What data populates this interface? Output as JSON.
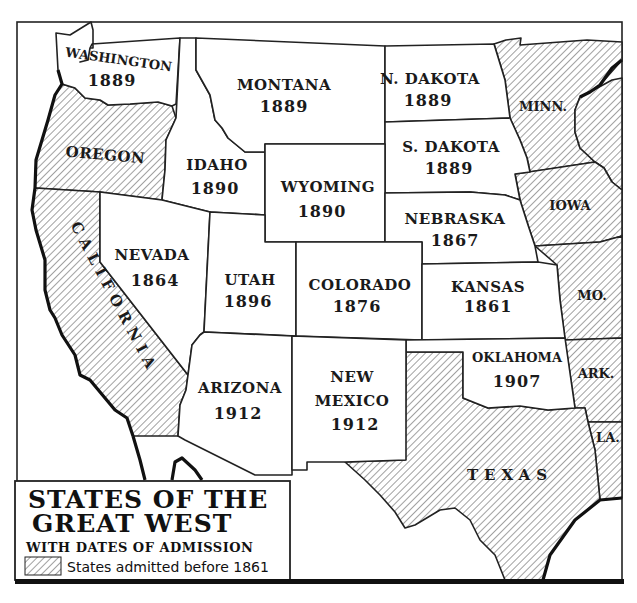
{
  "legend": {
    "title_line1": "STATES OF THE",
    "title_line2": "GREAT WEST",
    "subtitle": "WITH DATES OF ADMISSION",
    "key_label": "States admitted before 1861"
  },
  "states": {
    "washington": {
      "name": "WASHINGTON",
      "year": "1889"
    },
    "montana": {
      "name": "MONTANA",
      "year": "1889"
    },
    "north_dakota": {
      "name": "N. DAKOTA",
      "year": "1889"
    },
    "minnesota": {
      "name": "MINN."
    },
    "oregon": {
      "name": "OREGON"
    },
    "idaho": {
      "name": "IDAHO",
      "year": "1890"
    },
    "wyoming": {
      "name": "WYOMING",
      "year": "1890"
    },
    "south_dakota": {
      "name": "S. DAKOTA",
      "year": "1889"
    },
    "iowa": {
      "name": "IOWA"
    },
    "nebraska": {
      "name": "NEBRASKA",
      "year": "1867"
    },
    "california": {
      "name": "CALIFORNIA"
    },
    "nevada": {
      "name": "NEVADA",
      "year": "1864"
    },
    "utah": {
      "name": "UTAH",
      "year": "1896"
    },
    "colorado": {
      "name": "COLORADO",
      "year": "1876"
    },
    "kansas": {
      "name": "KANSAS",
      "year": "1861"
    },
    "missouri": {
      "name": "MO."
    },
    "arizona": {
      "name": "ARIZONA",
      "year": "1912"
    },
    "new_mexico": {
      "name_line1": "NEW",
      "name_line2": "MEXICO",
      "year": "1912"
    },
    "oklahoma": {
      "name": "OKLAHOMA",
      "year": "1907"
    },
    "arkansas": {
      "name": "ARK."
    },
    "louisiana": {
      "name": "LA."
    },
    "texas": {
      "name": "TEXAS"
    }
  },
  "colors": {
    "ink": "#1a1a1a",
    "paper": "#ffffff"
  }
}
